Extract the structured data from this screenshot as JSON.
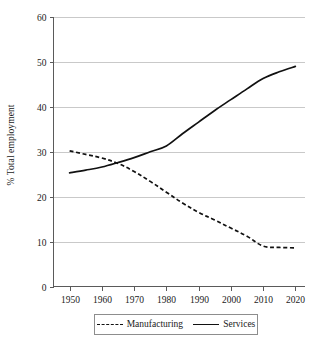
{
  "chart_data": {
    "type": "line",
    "title": "",
    "xlabel": "",
    "ylabel": "% Total employment",
    "xlim": [
      1945,
      2023
    ],
    "ylim": [
      0,
      60
    ],
    "grid": true,
    "legend_position": "bottom",
    "x_ticks": [
      "1950",
      "1960",
      "1970",
      "1980",
      "1990",
      "2000",
      "2010",
      "2020"
    ],
    "y_ticks": [
      "0",
      "10",
      "20",
      "30",
      "40",
      "50",
      "60"
    ],
    "x": [
      1950,
      1955,
      1960,
      1965,
      1970,
      1975,
      1980,
      1985,
      1990,
      1995,
      2000,
      2005,
      2010,
      2015,
      2020
    ],
    "series": [
      {
        "name": "Manufacturing",
        "style": "dashed",
        "color": "#111111",
        "values": [
          30.2,
          29.4,
          28.6,
          27.4,
          25.6,
          23.4,
          21.0,
          18.6,
          16.5,
          14.8,
          13.0,
          11.2,
          9.0,
          8.7,
          8.6
        ]
      },
      {
        "name": "Services",
        "style": "solid",
        "color": "#111111",
        "values": [
          25.3,
          25.9,
          26.6,
          27.6,
          28.7,
          30.0,
          31.3,
          34.0,
          36.6,
          39.2,
          41.6,
          44.0,
          46.3,
          47.8,
          49.0
        ]
      }
    ],
    "annotations": []
  },
  "legend": {
    "items": [
      {
        "label": "Manufacturing",
        "style": "dashed"
      },
      {
        "label": "Services",
        "style": "solid"
      }
    ]
  }
}
